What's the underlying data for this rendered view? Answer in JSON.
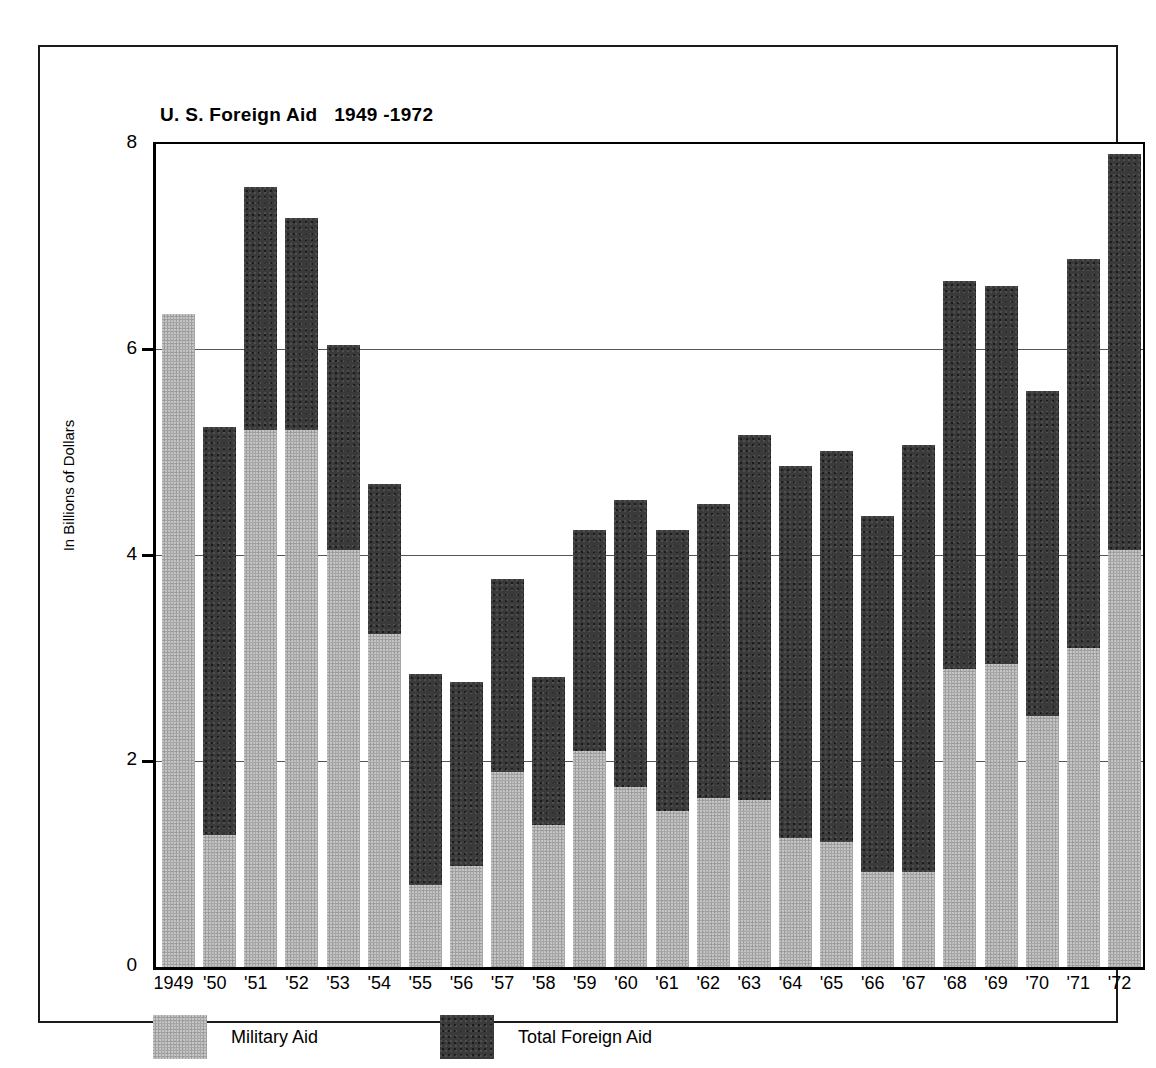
{
  "chart_data": {
    "type": "bar",
    "title": "U. S. Foreign Aid   1949 -1972",
    "xlabel": "",
    "ylabel": "In Billions of Dollars",
    "ylim": [
      0,
      8
    ],
    "yticks": [
      0,
      2,
      4,
      6,
      8
    ],
    "ytick_labels": [
      "0",
      "2",
      "4",
      "6",
      "8"
    ],
    "grid": "horizontal",
    "legend_position": "bottom-left",
    "stacked": true,
    "categories": [
      "1949",
      "'50",
      "'51",
      "'52",
      "'53",
      "'54",
      "'55",
      "'56",
      "'57",
      "'58",
      "'59",
      "'60",
      "'61",
      "'62",
      "'63",
      "'64",
      "'65",
      "'66",
      "'67",
      "'68",
      "'69",
      "'70",
      "'71",
      "'72"
    ],
    "series": [
      {
        "name": "Total Foreign Aid",
        "color": "#3a3a3a",
        "values": [
          6.35,
          5.25,
          7.58,
          7.28,
          6.05,
          4.7,
          2.85,
          2.77,
          3.77,
          2.82,
          4.25,
          4.54,
          4.25,
          4.5,
          5.17,
          4.87,
          5.02,
          4.38,
          5.07,
          6.67,
          6.62,
          5.6,
          6.88,
          7.9
        ]
      },
      {
        "name": "Military Aid",
        "color": "#a6a6a6",
        "values": [
          6.35,
          1.28,
          5.22,
          5.22,
          4.05,
          3.24,
          0.8,
          0.98,
          1.9,
          1.38,
          2.1,
          1.75,
          1.52,
          1.64,
          1.62,
          1.25,
          1.22,
          0.92,
          0.92,
          2.9,
          2.95,
          2.44,
          3.1,
          4.05
        ]
      }
    ],
    "legend": [
      {
        "label": "Military Aid",
        "swatch": "military"
      },
      {
        "label": "Total Foreign Aid",
        "swatch": "total"
      }
    ]
  }
}
